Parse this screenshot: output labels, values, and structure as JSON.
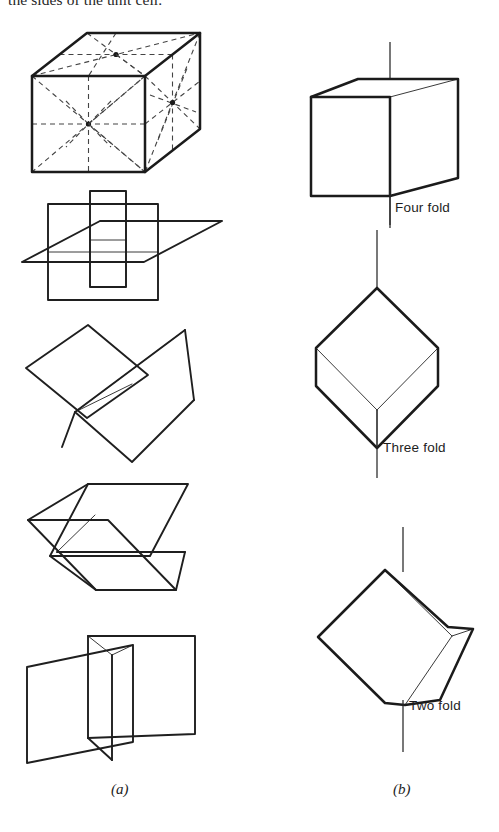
{
  "page": {
    "running_text": "the sides of the unit cell.",
    "background_color": "#ffffff",
    "ink_color": "#1b1b1b"
  },
  "figure": {
    "panel_a": {
      "caption": "(a)",
      "description": "Symmetry planes of a cube",
      "items": [
        {
          "name": "cube-with-dashed-symmetry-planes",
          "type": "cube",
          "style": "solid edges with dashed face diagonals, mid-lines and star intersections"
        },
        {
          "name": "three-mutually-perpendicular-planes",
          "type": "planes",
          "count": 3,
          "style": "axial mirror planes"
        },
        {
          "name": "two-intersecting-diagonal-planes-upper",
          "type": "planes",
          "count": 2,
          "style": "diagonal mirror planes, rhombic outline"
        },
        {
          "name": "two-intersecting-parallelogram-planes",
          "type": "planes",
          "count": 2,
          "style": "diagonal mirror planes, parallelogram outline"
        },
        {
          "name": "two-perpendicular-vertical-planes",
          "type": "planes",
          "count": 2,
          "style": "vertical mirror planes"
        }
      ]
    },
    "panel_b": {
      "caption": "(b)",
      "description": "Rotation axes of a cube",
      "items": [
        {
          "name": "cube-four-fold-axis",
          "label": "Four fold",
          "axis_order": 4,
          "orientation": "through face centres"
        },
        {
          "name": "cube-three-fold-axis",
          "label": "Three fold",
          "axis_order": 3,
          "orientation": "through body diagonal / corners"
        },
        {
          "name": "cube-two-fold-axis",
          "label": "Two fold",
          "axis_order": 2,
          "orientation": "through edge centres"
        }
      ]
    }
  }
}
